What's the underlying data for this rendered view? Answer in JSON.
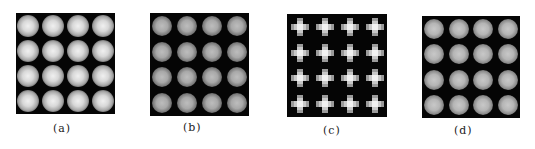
{
  "figure": {
    "panels": [
      {
        "id": "a",
        "label": "(a)",
        "pattern": "circular-spots",
        "rows": 4,
        "cols": 4,
        "spot_style": "bright-sharp"
      },
      {
        "id": "b",
        "label": "(b)",
        "pattern": "circular-spots",
        "rows": 4,
        "cols": 4,
        "spot_style": "dim-noisy"
      },
      {
        "id": "c",
        "label": "(c)",
        "pattern": "cross-spots",
        "rows": 4,
        "cols": 4,
        "spot_style": "pixelated-cross"
      },
      {
        "id": "d",
        "label": "(d)",
        "pattern": "circular-spots",
        "rows": 4,
        "cols": 4,
        "spot_style": "medium-smooth"
      }
    ],
    "colors": {
      "background": "#ffffff",
      "panel": "#050505",
      "spot": "#d8d8d8"
    }
  }
}
